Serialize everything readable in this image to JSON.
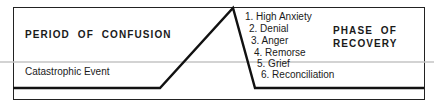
{
  "diagram": {
    "left_region": {
      "title": "PERIOD OF CONFUSION",
      "event_label": "Catastrophic Event"
    },
    "right_region": {
      "title_line1": "PHASE OF",
      "title_line2": "RECOVERY"
    },
    "stages": [
      {
        "label": "1. High Anxiety"
      },
      {
        "label": "2. Denial"
      },
      {
        "label": "3. Anger"
      },
      {
        "label": "4. Remorse"
      },
      {
        "label": "5. Grief"
      },
      {
        "label": "6. Reconciliation"
      }
    ],
    "colors": {
      "line": "#111111",
      "border": "#222222",
      "scan_line": "#bdbdbd",
      "background": "#ffffff"
    }
  }
}
